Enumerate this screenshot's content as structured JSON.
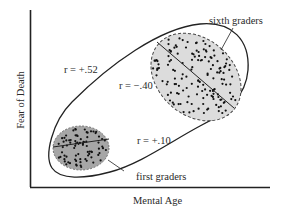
{
  "diagram": {
    "type": "scatter-illustration",
    "axes": {
      "x_label": "Mental Age",
      "y_label": "Fear of Death"
    },
    "groups": [
      {
        "name": "first graders",
        "label": "first graders",
        "correlation_label": "r = +.10",
        "fill": "#a6a6a6",
        "border_style": "solid"
      },
      {
        "name": "sixth graders",
        "label": "sixth graders",
        "correlation_label": "r = −.40",
        "fill": "#dcdcdc",
        "border_style": "dashed"
      }
    ],
    "overall": {
      "correlation_label": "r = +.52"
    },
    "colors": {
      "line": "#222222",
      "text": "#2a2a2a",
      "dots": "#111111"
    }
  }
}
